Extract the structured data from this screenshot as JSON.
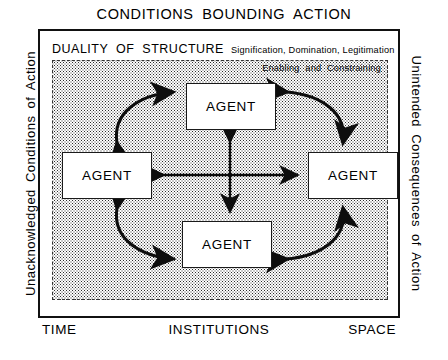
{
  "diagram": {
    "top_title": "CONDITIONS BOUNDING ACTION",
    "left_label": "Unacknowledged Conditions of Action",
    "right_label": "Unintended Consequences of Action",
    "bottom_left_label": "TIME",
    "bottom_center_label": "INSTITUTIONS",
    "bottom_right_label": "SPACE",
    "duality": {
      "main": "DUALITY OF STRUCTURE",
      "sub": "Signification, Domination, Legitimation"
    },
    "enabling_label": "Enabling and Constraining",
    "agents": [
      {
        "id": "agent-top",
        "label": "AGENT"
      },
      {
        "id": "agent-left",
        "label": "AGENT"
      },
      {
        "id": "agent-right",
        "label": "AGENT"
      },
      {
        "id": "agent-bottom",
        "label": "AGENT"
      }
    ],
    "arrows": {
      "center_horizontal": "double-headed-horizontal-arrow",
      "center_vertical": "double-headed-vertical-arrow",
      "corner_top_left": "double-headed-curved-arrow",
      "corner_top_right": "double-headed-curved-arrow",
      "corner_bottom_left": "double-headed-curved-arrow",
      "corner_bottom_right": "double-headed-curved-arrow"
    },
    "colors": {
      "ink": "#111111",
      "paper": "#ffffff",
      "stipple": "#2b2b2b"
    }
  }
}
